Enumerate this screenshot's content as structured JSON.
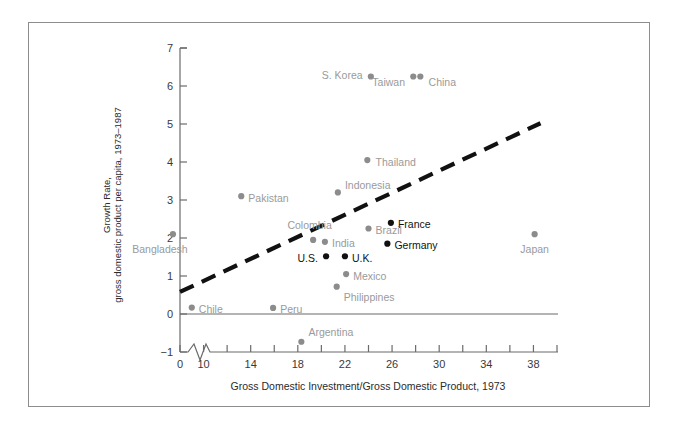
{
  "chart_data": {
    "type": "scatter",
    "title": "",
    "xlabel": "Gross Domestic Investment/Gross Domestic Product, 1973",
    "ylabel_line1": "Growth Rate,",
    "ylabel_line2": "gross domestic product per capita, 1973–1987",
    "xlim": [
      8,
      40
    ],
    "ylim": [
      -1,
      7
    ],
    "x_axis_break": true,
    "x_origin_label": "0",
    "xticks": [
      8,
      10,
      12,
      14,
      16,
      18,
      20,
      22,
      24,
      26,
      28,
      30,
      32,
      34,
      36,
      38,
      40
    ],
    "xticklabels": [
      "",
      "10",
      "",
      "14",
      "",
      "18",
      "",
      "22",
      "",
      "26",
      "",
      "30",
      "",
      "34",
      "",
      "38",
      ""
    ],
    "yticks": [
      -1,
      0,
      1,
      2,
      3,
      4,
      5,
      6,
      7
    ],
    "yticklabels": [
      "−1",
      "0",
      "1",
      "2",
      "3",
      "4",
      "5",
      "6",
      "7"
    ],
    "grid": false,
    "legend": "none",
    "series": [
      {
        "name": "Developing / other economies",
        "color": "#8c8c8c",
        "label_color": "#9a9a9a",
        "points": [
          {
            "label": "Bangladesh",
            "x": 7.4,
            "y": 2.1,
            "lx": 6.3,
            "ly": 1.72,
            "anchor": "middle"
          },
          {
            "label": "Pakistan",
            "x": 13.2,
            "y": 3.1,
            "lx": 13.8,
            "ly": 3.06,
            "anchor": "start"
          },
          {
            "label": "Colombia",
            "x": 19.3,
            "y": 1.95,
            "lx": 19.0,
            "ly": 2.33,
            "anchor": "middle"
          },
          {
            "label": "India",
            "x": 20.3,
            "y": 1.9,
            "lx": 20.9,
            "ly": 1.86,
            "anchor": "start"
          },
          {
            "label": "Indonesia",
            "x": 21.4,
            "y": 3.2,
            "lx": 22.0,
            "ly": 3.4,
            "anchor": "start"
          },
          {
            "label": "Brazil",
            "x": 24.0,
            "y": 2.25,
            "lx": 24.6,
            "ly": 2.21,
            "anchor": "start"
          },
          {
            "label": "Thailand",
            "x": 23.9,
            "y": 4.05,
            "lx": 24.6,
            "ly": 4.01,
            "anchor": "start"
          },
          {
            "label": "S. Korea",
            "x": 24.2,
            "y": 6.25,
            "lx": 23.5,
            "ly": 6.29,
            "anchor": "end"
          },
          {
            "label": "Taiwan",
            "x": 27.8,
            "y": 6.25,
            "lx": 27.1,
            "ly": 6.1,
            "anchor": "end"
          },
          {
            "label": "China",
            "x": 28.4,
            "y": 6.25,
            "lx": 29.1,
            "ly": 6.1,
            "anchor": "start"
          },
          {
            "label": "Mexico",
            "x": 22.1,
            "y": 1.05,
            "lx": 22.7,
            "ly": 1.01,
            "anchor": "start"
          },
          {
            "label": "Philippines",
            "x": 21.3,
            "y": 0.72,
            "lx": 21.9,
            "ly": 0.46,
            "anchor": "start"
          },
          {
            "label": "Chile",
            "x": 9.0,
            "y": 0.17,
            "lx": 9.6,
            "ly": 0.13,
            "anchor": "start"
          },
          {
            "label": "Peru",
            "x": 15.9,
            "y": 0.16,
            "lx": 16.5,
            "ly": 0.12,
            "anchor": "start"
          },
          {
            "label": "Argentina",
            "x": 18.3,
            "y": -0.73,
            "lx": 18.9,
            "ly": -0.48,
            "anchor": "start"
          },
          {
            "label": "Japan",
            "x": 38.1,
            "y": 2.1,
            "lx": 38.1,
            "ly": 1.72,
            "anchor": "middle"
          }
        ]
      },
      {
        "name": "Industrial economies",
        "color": "#111111",
        "label_color": "#111111",
        "points": [
          {
            "label": "U.S.",
            "x": 20.4,
            "y": 1.52,
            "lx": 19.7,
            "ly": 1.48,
            "anchor": "end"
          },
          {
            "label": "U.K.",
            "x": 22.0,
            "y": 1.52,
            "lx": 22.6,
            "ly": 1.48,
            "anchor": "start"
          },
          {
            "label": "France",
            "x": 25.9,
            "y": 2.4,
            "lx": 26.5,
            "ly": 2.36,
            "anchor": "start"
          },
          {
            "label": "Germany",
            "x": 25.6,
            "y": 1.85,
            "lx": 26.2,
            "ly": 1.81,
            "anchor": "start"
          }
        ]
      }
    ],
    "trend_line": {
      "style": "dashed",
      "color": "#111111",
      "x0": 8.0,
      "y0": 0.58,
      "x1": 38.6,
      "y1": 5.02
    }
  }
}
